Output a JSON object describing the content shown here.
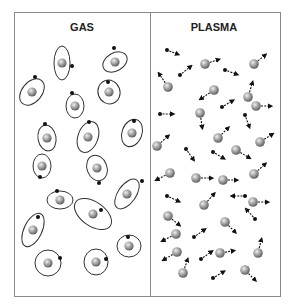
{
  "panels": [
    {
      "id": "gas",
      "title": "GAS",
      "description": "Neutral atoms: nucleus with a bound electron on an elliptical orbit",
      "atoms": [
        {
          "cx": 62,
          "cy": 63,
          "rx": 8,
          "ry": 17,
          "rot": 0,
          "ex": 72,
          "ey": 66
        },
        {
          "cx": 115,
          "cy": 62,
          "rx": 13,
          "ry": 9,
          "rot": -30,
          "ex": 114,
          "ey": 48
        },
        {
          "cx": 32,
          "cy": 92,
          "rx": 15,
          "ry": 10,
          "rot": -50,
          "ex": 35,
          "ey": 77
        },
        {
          "cx": 75,
          "cy": 106,
          "rx": 9,
          "ry": 12,
          "rot": 0,
          "ex": 72,
          "ey": 93
        },
        {
          "cx": 109,
          "cy": 92,
          "rx": 11,
          "ry": 12,
          "rot": -20,
          "ex": 108,
          "ey": 82
        },
        {
          "cx": 47,
          "cy": 138,
          "rx": 9,
          "ry": 13,
          "rot": -10,
          "ex": 45,
          "ey": 124
        },
        {
          "cx": 88,
          "cy": 137,
          "rx": 10,
          "ry": 16,
          "rot": 20,
          "ex": 89,
          "ey": 122
        },
        {
          "cx": 132,
          "cy": 133,
          "rx": 10,
          "ry": 14,
          "rot": 20,
          "ex": 134,
          "ey": 121
        },
        {
          "cx": 42,
          "cy": 166,
          "rx": 9,
          "ry": 12,
          "rot": 0,
          "ex": 40,
          "ey": 177
        },
        {
          "cx": 97,
          "cy": 168,
          "rx": 10,
          "ry": 13,
          "rot": -20,
          "ex": 99,
          "ey": 183
        },
        {
          "cx": 60,
          "cy": 200,
          "rx": 13,
          "ry": 9,
          "rot": 0,
          "ex": 57,
          "ey": 191
        },
        {
          "cx": 127,
          "cy": 194,
          "rx": 17,
          "ry": 9,
          "rot": -55,
          "ex": 142,
          "ey": 181
        },
        {
          "cx": 93,
          "cy": 214,
          "rx": 12,
          "ry": 21,
          "rot": -55,
          "ex": 101,
          "ey": 210
        },
        {
          "cx": 33,
          "cy": 230,
          "rx": 9,
          "ry": 18,
          "rot": 25,
          "ex": 38,
          "ey": 217
        },
        {
          "cx": 129,
          "cy": 246,
          "rx": 12,
          "ry": 11,
          "rot": 0,
          "ex": 128,
          "ey": 237
        },
        {
          "cx": 48,
          "cy": 263,
          "rx": 13,
          "ry": 13,
          "rot": 0,
          "ex": 60,
          "ey": 258
        },
        {
          "cx": 96,
          "cy": 262,
          "rx": 12,
          "ry": 13,
          "rot": 0,
          "ex": 106,
          "ey": 259
        }
      ]
    },
    {
      "id": "plasma",
      "title": "PLASMA",
      "description": "Free ions and free electrons moving in random directions",
      "ions": [
        {
          "x": 205,
          "y": 64,
          "dx": 12,
          "dy": -4
        },
        {
          "x": 254,
          "y": 64,
          "dx": 10,
          "dy": -8
        },
        {
          "x": 168,
          "y": 87,
          "dx": -8,
          "dy": -12
        },
        {
          "x": 214,
          "y": 90,
          "dx": -12,
          "dy": 8
        },
        {
          "x": 248,
          "y": 97,
          "dx": 4,
          "dy": -13
        },
        {
          "x": 256,
          "y": 106,
          "dx": 13,
          "dy": 0
        },
        {
          "x": 200,
          "y": 113,
          "dx": 2,
          "dy": 13
        },
        {
          "x": 157,
          "y": 146,
          "dx": 10,
          "dy": -9
        },
        {
          "x": 218,
          "y": 138,
          "dx": 9,
          "dy": -9
        },
        {
          "x": 260,
          "y": 142,
          "dx": 11,
          "dy": -7
        },
        {
          "x": 236,
          "y": 150,
          "dx": 12,
          "dy": 7
        },
        {
          "x": 170,
          "y": 173,
          "dx": -12,
          "dy": 6
        },
        {
          "x": 196,
          "y": 178,
          "dx": 14,
          "dy": 0
        },
        {
          "x": 223,
          "y": 180,
          "dx": 12,
          "dy": 0
        },
        {
          "x": 254,
          "y": 174,
          "dx": 10,
          "dy": -9
        },
        {
          "x": 204,
          "y": 205,
          "dx": 9,
          "dy": -10
        },
        {
          "x": 253,
          "y": 202,
          "dx": 13,
          "dy": 0
        },
        {
          "x": 168,
          "y": 216,
          "dx": 10,
          "dy": 8
        },
        {
          "x": 225,
          "y": 222,
          "dx": 9,
          "dy": 9
        },
        {
          "x": 176,
          "y": 234,
          "dx": -12,
          "dy": 6
        },
        {
          "x": 177,
          "y": 252,
          "dx": -12,
          "dy": 7
        },
        {
          "x": 220,
          "y": 253,
          "dx": 12,
          "dy": -2
        },
        {
          "x": 258,
          "y": 253,
          "dx": 3,
          "dy": -12
        },
        {
          "x": 183,
          "y": 273,
          "dx": 4,
          "dy": -12
        },
        {
          "x": 245,
          "y": 270,
          "dx": 9,
          "dy": 9
        }
      ],
      "electrons": [
        {
          "x": 167,
          "y": 50,
          "dx": 10,
          "dy": 4
        },
        {
          "x": 180,
          "y": 75,
          "dx": 10,
          "dy": -8
        },
        {
          "x": 225,
          "y": 70,
          "dx": 11,
          "dy": 4
        },
        {
          "x": 160,
          "y": 114,
          "dx": 12,
          "dy": 0
        },
        {
          "x": 222,
          "y": 107,
          "dx": 10,
          "dy": -6
        },
        {
          "x": 245,
          "y": 115,
          "dx": 4,
          "dy": 11
        },
        {
          "x": 186,
          "y": 149,
          "dx": 7,
          "dy": 10
        },
        {
          "x": 213,
          "y": 152,
          "dx": 10,
          "dy": 6
        },
        {
          "x": 167,
          "y": 196,
          "dx": 11,
          "dy": 5
        },
        {
          "x": 245,
          "y": 196,
          "dx": -12,
          "dy": 0
        },
        {
          "x": 255,
          "y": 219,
          "dx": -8,
          "dy": -9
        },
        {
          "x": 194,
          "y": 237,
          "dx": 10,
          "dy": -7
        },
        {
          "x": 201,
          "y": 259,
          "dx": 10,
          "dy": -7
        },
        {
          "x": 213,
          "y": 278,
          "dx": 10,
          "dy": -6
        }
      ]
    }
  ],
  "colors": {
    "border": "#8a8a8a",
    "text": "#222222",
    "orbit": "#333333",
    "electron": "#111111",
    "arrow": "#111111",
    "nucleus_light": "#e8e8e8",
    "nucleus_mid": "#9a9a9a",
    "nucleus_dark": "#555555"
  }
}
